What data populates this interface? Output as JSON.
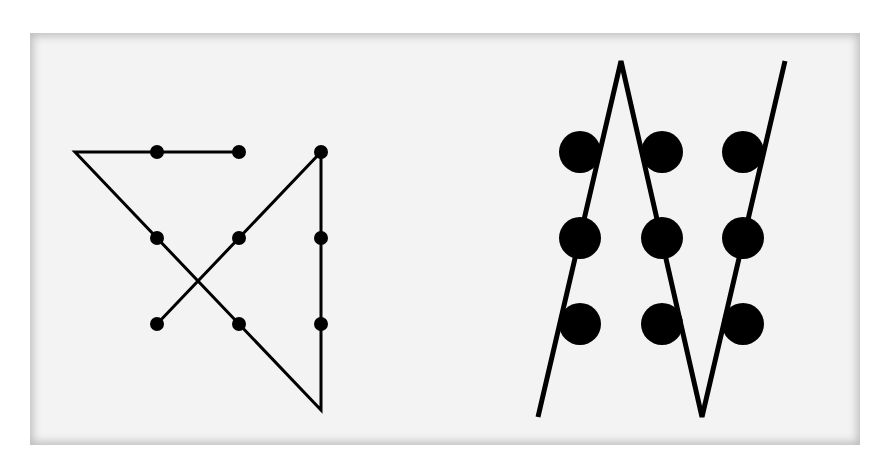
{
  "diagram": {
    "panel_background": "#f3f3f3",
    "line_color": "#000000",
    "left_figure": {
      "description": "Four-line solution extending beyond the grid",
      "dots": [
        {
          "x": 157,
          "y": 152
        },
        {
          "x": 239,
          "y": 152
        },
        {
          "x": 321,
          "y": 152
        },
        {
          "x": 157,
          "y": 238
        },
        {
          "x": 239,
          "y": 238
        },
        {
          "x": 321,
          "y": 238
        },
        {
          "x": 157,
          "y": 324
        },
        {
          "x": 239,
          "y": 324
        },
        {
          "x": 321,
          "y": 324
        }
      ],
      "dot_radius": 7,
      "path": [
        [
          239,
          152
        ],
        [
          75,
          152
        ],
        [
          321,
          410
        ],
        [
          321,
          152
        ],
        [
          157,
          324
        ]
      ]
    },
    "right_figure": {
      "description": "Three-line solution using large dots",
      "dots": [
        {
          "x": 580,
          "y": 152
        },
        {
          "x": 662,
          "y": 152
        },
        {
          "x": 743,
          "y": 152
        },
        {
          "x": 580,
          "y": 238
        },
        {
          "x": 662,
          "y": 238
        },
        {
          "x": 743,
          "y": 238
        },
        {
          "x": 580,
          "y": 324
        },
        {
          "x": 662,
          "y": 324
        },
        {
          "x": 743,
          "y": 324
        }
      ],
      "dot_radius": 21,
      "path": [
        [
          538,
          417
        ],
        [
          621,
          61
        ],
        [
          702,
          417
        ],
        [
          785,
          61
        ]
      ]
    }
  }
}
